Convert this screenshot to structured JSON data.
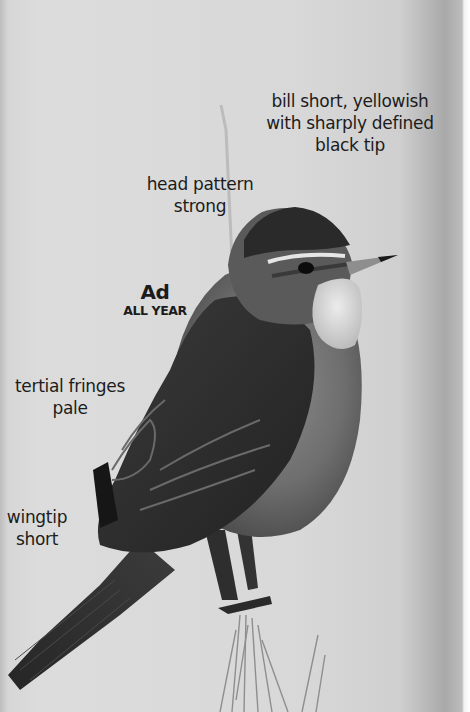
{
  "image": {
    "subject": "perched warbler, adult, side view on grass stem",
    "colors": {
      "background": "#d8d8d8",
      "right_edge_shadow": "#a9a9a9",
      "bird_dark": "#2a2a2a",
      "bird_mid": "#5a5a5a",
      "throat_pale": "#e2e2e2",
      "label_text": "#1c1c1c"
    }
  },
  "annotations": {
    "bill": {
      "line1": "bill short, yellowish",
      "line2": "with sharply defined",
      "line3": "black tip"
    },
    "head": {
      "line1": "head pattern",
      "line2": "strong"
    },
    "age": {
      "age": "Ad",
      "season": "ALL YEAR"
    },
    "tertials": {
      "line1": "tertial fringes",
      "line2": "pale"
    },
    "wingtip": {
      "line1": "wingtip",
      "line2": "short"
    }
  }
}
